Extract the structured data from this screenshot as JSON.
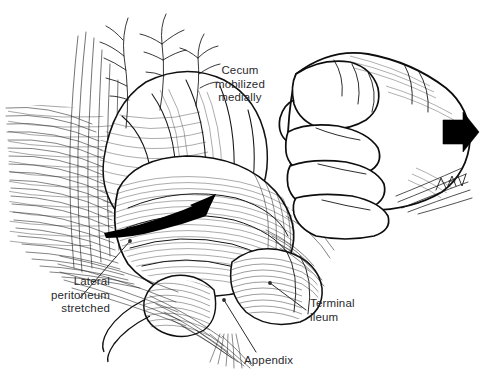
{
  "figure": {
    "type": "medical-illustration",
    "style": "pen-and-ink line drawing",
    "background_color": "#ffffff",
    "ink_color": "#1a1a1a",
    "label_color": "#2a2a2e"
  },
  "labels": {
    "cecum": "Cecum\nmobilized\nmedially",
    "lateral_peritoneum": "Lateral\nperitoneum\nstretched",
    "terminal_ileum": "Terminal\nileum",
    "appendix": "Appendix"
  },
  "annotations": {
    "signature": "LHV",
    "traction_arrow_direction": "right",
    "mobilization_arrow_direction": "up-right"
  }
}
